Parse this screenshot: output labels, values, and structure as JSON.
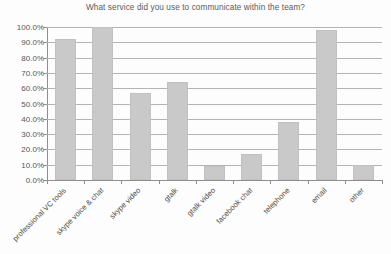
{
  "chart_data": {
    "type": "bar",
    "title": "What service did you use to communicate within the team?",
    "xlabel": "",
    "ylabel": "",
    "categories": [
      "professional VC tools",
      "skype voice & chat",
      "skype video",
      "gtalk",
      "gtalk video",
      "facebook chat",
      "telephone",
      "email",
      "other"
    ],
    "values": [
      92,
      100,
      57,
      64,
      9,
      17,
      38,
      98,
      10
    ],
    "value_labels": [
      "92.0%",
      "100.0%",
      "57.0%",
      "64.0%",
      "9.0%",
      "17.0%",
      "38.0%",
      "98.0%",
      "10.0%"
    ],
    "ylim": [
      0,
      100
    ],
    "ytick_values": [
      0,
      10,
      20,
      30,
      40,
      50,
      60,
      70,
      80,
      90,
      100
    ],
    "ytick_labels": [
      "0.0%",
      "10.0%",
      "20.0%",
      "30.0%",
      "40.0%",
      "50.0%",
      "60.0%",
      "70.0%",
      "80.0%",
      "90.0%",
      "100.0%"
    ],
    "grid": true,
    "legend": false,
    "legend_position": "none",
    "series": [
      {
        "name": "Usage",
        "values": [
          92,
          100,
          57,
          64,
          9,
          17,
          38,
          98,
          10
        ]
      }
    ],
    "colors": {
      "bar_fill": "#c9c9c9",
      "bar_border": "#c1c1c1",
      "gridline": "#b4b4b4",
      "axis": "#8e8e8e",
      "text": "#555555",
      "title_text": "#5a5a5a",
      "background": "#fdfdfd"
    }
  }
}
